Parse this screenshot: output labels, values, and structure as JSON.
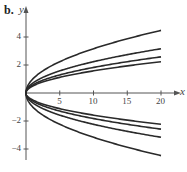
{
  "panel_label": "b.",
  "chart_data": {
    "type": "line",
    "title": "",
    "xlabel": "x",
    "ylabel": "y",
    "xlim": [
      0,
      20
    ],
    "ylim": [
      -5,
      5
    ],
    "grid": false,
    "legend": null,
    "x_ticks": [
      5,
      10,
      15,
      20
    ],
    "x_tick_labels": [
      "5",
      "10",
      "15",
      "20"
    ],
    "y_ticks": [
      4,
      2,
      -2,
      -4
    ],
    "y_tick_labels": [
      "4",
      "2",
      "−2",
      "−4"
    ],
    "series": [
      {
        "name": "y = sqrt(x)",
        "x": [
          0,
          5,
          10,
          15,
          20
        ],
        "values": [
          0,
          2.24,
          3.16,
          3.87,
          4.47
        ]
      },
      {
        "name": "y = sqrt(x/2)",
        "x": [
          0,
          5,
          10,
          15,
          20
        ],
        "values": [
          0,
          1.58,
          2.24,
          2.74,
          3.16
        ]
      },
      {
        "name": "y = sqrt(x/3)",
        "x": [
          0,
          5,
          10,
          15,
          20
        ],
        "values": [
          0,
          1.29,
          1.83,
          2.24,
          2.58
        ]
      },
      {
        "name": "y = sqrt(x/4)",
        "x": [
          0,
          5,
          10,
          15,
          20
        ],
        "values": [
          0,
          1.12,
          1.58,
          1.94,
          2.24
        ]
      },
      {
        "name": "y = -sqrt(x/4)",
        "x": [
          0,
          5,
          10,
          15,
          20
        ],
        "values": [
          0,
          -1.12,
          -1.58,
          -1.94,
          -2.24
        ]
      },
      {
        "name": "y = -sqrt(x/3)",
        "x": [
          0,
          5,
          10,
          15,
          20
        ],
        "values": [
          0,
          -1.29,
          -1.83,
          -2.24,
          -2.58
        ]
      },
      {
        "name": "y = -sqrt(x/2)",
        "x": [
          0,
          5,
          10,
          15,
          20
        ],
        "values": [
          0,
          -1.58,
          -2.24,
          -2.74,
          -3.16
        ]
      },
      {
        "name": "y = -sqrt(x)",
        "x": [
          0,
          5,
          10,
          15,
          20
        ],
        "values": [
          0,
          -2.24,
          -3.16,
          -3.87,
          -4.47
        ]
      }
    ],
    "colors": {
      "curve": "#2a2a2a",
      "axis": "#555555"
    }
  }
}
